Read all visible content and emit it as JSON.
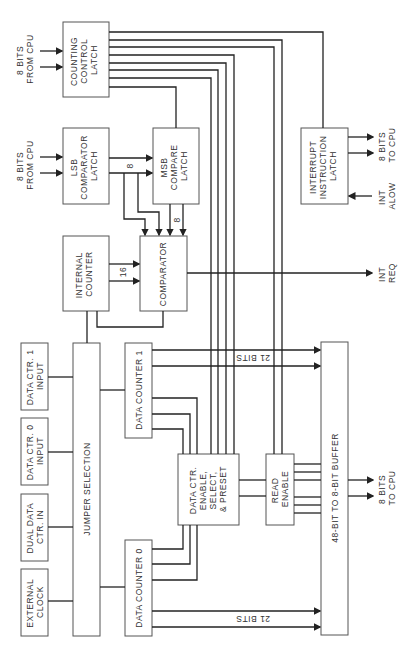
{
  "diagram": {
    "title": "",
    "blocks": {
      "counting_control_latch": [
        "COUNTING",
        "CONTROL",
        "LATCH"
      ],
      "lsb_comparator_latch": [
        "LSB",
        "COMPARATOR",
        "LATCH"
      ],
      "msb_compare_latch": [
        "MSB",
        "COMPARE",
        "LATCH"
      ],
      "internal_counter": [
        "INTERNAL",
        "COUNTER"
      ],
      "comparator": [
        "COMPARATOR"
      ],
      "interrupt_instruction_latch": [
        "INTERRUPT",
        "INSTRUCTION",
        "LATCH"
      ],
      "data_ctr1_input": [
        "DATA CTR. 1",
        "INPUT"
      ],
      "data_ctr0_input": [
        "DATA CTR. 0",
        "INPUT"
      ],
      "dual_data_ctr_in": [
        "DUAL DATA",
        "CTR. IN"
      ],
      "external_clock": [
        "EXTERNAL",
        "CLOCK"
      ],
      "jumper_selection": [
        "JUMPER SELECTION"
      ],
      "data_counter_1": [
        "DATA COUNTER 1"
      ],
      "data_counter_0": [
        "DATA COUNTER 0"
      ],
      "data_ctr_enable": [
        "DATA CTR.",
        "ENABLE,",
        "SELECT,",
        "& PRESET"
      ],
      "read_enable": [
        "READ",
        "ENABLE"
      ],
      "buffer": [
        "48-BIT TO 8-BIT BUFFER"
      ]
    },
    "signals": {
      "cpu_in_1": [
        "8 BITS",
        "FROM CPU"
      ],
      "cpu_in_2": [
        "8 BITS",
        "FROM CPU"
      ],
      "cpu_out_1": [
        "8 BITS",
        "TO CPU"
      ],
      "cpu_out_2": [
        "8 BITS",
        "TO CPU"
      ],
      "int_alow": [
        "INT",
        "ALOW"
      ],
      "int_req": [
        "INT",
        "REQ"
      ],
      "bus_lsb_msb": "8",
      "bus_msb_cmp": "8",
      "bus_counter_cmp": "16",
      "bus_dc1": "21 BITS",
      "bus_dc0": "21 BITS"
    },
    "colors": {
      "line": "#222222",
      "box": "#555555",
      "text": "#333333"
    }
  }
}
